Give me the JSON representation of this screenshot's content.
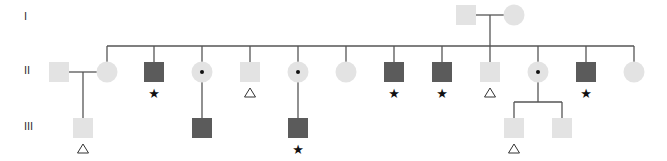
{
  "colors": {
    "unaffected": "#e3e3e3",
    "affected": "#5b5b5b",
    "line": "#555555",
    "carrier_dot": "#111111",
    "background": "#ffffff"
  },
  "generations": [
    {
      "label": "I",
      "y": 20
    },
    {
      "label": "II",
      "y": 74
    },
    {
      "label": "III",
      "y": 130
    }
  ],
  "individuals": [
    {
      "id": "I-1",
      "gen": "I",
      "sex": "male",
      "x": 466,
      "y": 15,
      "status": "unaffected",
      "marker": ""
    },
    {
      "id": "I-2",
      "gen": "I",
      "sex": "female",
      "x": 514,
      "y": 15,
      "status": "unaffected",
      "marker": ""
    },
    {
      "id": "II-spouse",
      "gen": "II",
      "sex": "male",
      "x": 59,
      "y": 72,
      "status": "unaffected",
      "marker": ""
    },
    {
      "id": "II-1",
      "gen": "II",
      "sex": "female",
      "x": 107,
      "y": 72,
      "status": "unaffected",
      "marker": ""
    },
    {
      "id": "II-2",
      "gen": "II",
      "sex": "male",
      "x": 154,
      "y": 72,
      "status": "affected",
      "marker": "*"
    },
    {
      "id": "II-3",
      "gen": "II",
      "sex": "female",
      "x": 202,
      "y": 72,
      "status": "carrier",
      "marker": ""
    },
    {
      "id": "II-4",
      "gen": "II",
      "sex": "male",
      "x": 250,
      "y": 72,
      "status": "unaffected",
      "marker": "triangle"
    },
    {
      "id": "II-5",
      "gen": "II",
      "sex": "female",
      "x": 298,
      "y": 72,
      "status": "carrier",
      "marker": ""
    },
    {
      "id": "II-6",
      "gen": "II",
      "sex": "female",
      "x": 346,
      "y": 72,
      "status": "unaffected",
      "marker": ""
    },
    {
      "id": "II-7",
      "gen": "II",
      "sex": "male",
      "x": 394,
      "y": 72,
      "status": "affected",
      "marker": "*"
    },
    {
      "id": "II-8",
      "gen": "II",
      "sex": "male",
      "x": 442,
      "y": 72,
      "status": "affected",
      "marker": "*"
    },
    {
      "id": "II-9",
      "gen": "II",
      "sex": "male",
      "x": 490,
      "y": 72,
      "status": "unaffected",
      "marker": "triangle"
    },
    {
      "id": "II-10",
      "gen": "II",
      "sex": "female",
      "x": 538,
      "y": 72,
      "status": "carrier",
      "marker": ""
    },
    {
      "id": "II-11",
      "gen": "II",
      "sex": "male",
      "x": 586,
      "y": 72,
      "status": "affected",
      "marker": "*"
    },
    {
      "id": "II-12",
      "gen": "II",
      "sex": "female",
      "x": 634,
      "y": 72,
      "status": "unaffected",
      "marker": ""
    },
    {
      "id": "III-1",
      "gen": "III",
      "sex": "male",
      "x": 83,
      "y": 128,
      "status": "unaffected",
      "marker": "triangle"
    },
    {
      "id": "III-2",
      "gen": "III",
      "sex": "male",
      "x": 202,
      "y": 128,
      "status": "affected",
      "marker": ""
    },
    {
      "id": "III-3",
      "gen": "III",
      "sex": "male",
      "x": 298,
      "y": 128,
      "status": "affected",
      "marker": "*"
    },
    {
      "id": "III-4",
      "gen": "III",
      "sex": "male",
      "x": 514,
      "y": 128,
      "status": "unaffected",
      "marker": "triangle"
    },
    {
      "id": "III-5",
      "gen": "III",
      "sex": "male",
      "x": 562,
      "y": 128,
      "status": "unaffected",
      "marker": ""
    }
  ],
  "lines": [
    {
      "name": "gen-I-marriage-line",
      "x1": 476,
      "y1": 15,
      "x2": 504,
      "y2": 15
    },
    {
      "name": "gen-I-descent-line",
      "x1": 490,
      "y1": 15,
      "x2": 490,
      "y2": 46
    },
    {
      "name": "gen-II-sibship-line",
      "x1": 107,
      "y1": 46,
      "x2": 634,
      "y2": 46
    },
    {
      "name": "drop-II-1",
      "x1": 107,
      "y1": 46,
      "x2": 107,
      "y2": 62
    },
    {
      "name": "drop-II-2",
      "x1": 154,
      "y1": 46,
      "x2": 154,
      "y2": 62
    },
    {
      "name": "drop-II-3",
      "x1": 202,
      "y1": 46,
      "x2": 202,
      "y2": 62
    },
    {
      "name": "drop-II-4",
      "x1": 250,
      "y1": 46,
      "x2": 250,
      "y2": 62
    },
    {
      "name": "drop-II-5",
      "x1": 298,
      "y1": 46,
      "x2": 298,
      "y2": 62
    },
    {
      "name": "drop-II-6",
      "x1": 346,
      "y1": 46,
      "x2": 346,
      "y2": 62
    },
    {
      "name": "drop-II-7",
      "x1": 394,
      "y1": 46,
      "x2": 394,
      "y2": 62
    },
    {
      "name": "drop-II-8",
      "x1": 442,
      "y1": 46,
      "x2": 442,
      "y2": 62
    },
    {
      "name": "drop-II-9",
      "x1": 490,
      "y1": 46,
      "x2": 490,
      "y2": 62
    },
    {
      "name": "drop-II-10",
      "x1": 538,
      "y1": 46,
      "x2": 538,
      "y2": 62
    },
    {
      "name": "drop-II-11",
      "x1": 586,
      "y1": 46,
      "x2": 586,
      "y2": 62
    },
    {
      "name": "drop-II-12",
      "x1": 634,
      "y1": 46,
      "x2": 634,
      "y2": 62
    },
    {
      "name": "gen-II-marriage-line",
      "x1": 69,
      "y1": 72,
      "x2": 97,
      "y2": 72
    },
    {
      "name": "descent-III-1",
      "x1": 83,
      "y1": 72,
      "x2": 83,
      "y2": 118
    },
    {
      "name": "descent-III-2",
      "x1": 202,
      "y1": 82,
      "x2": 202,
      "y2": 118
    },
    {
      "name": "descent-III-3",
      "x1": 298,
      "y1": 82,
      "x2": 298,
      "y2": 118
    },
    {
      "name": "descent-II-10",
      "x1": 538,
      "y1": 82,
      "x2": 538,
      "y2": 102
    },
    {
      "name": "sibship-III-4-5",
      "x1": 514,
      "y1": 102,
      "x2": 562,
      "y2": 102
    },
    {
      "name": "drop-III-4",
      "x1": 514,
      "y1": 102,
      "x2": 514,
      "y2": 118
    },
    {
      "name": "drop-III-5",
      "x1": 562,
      "y1": 102,
      "x2": 562,
      "y2": 118
    }
  ]
}
